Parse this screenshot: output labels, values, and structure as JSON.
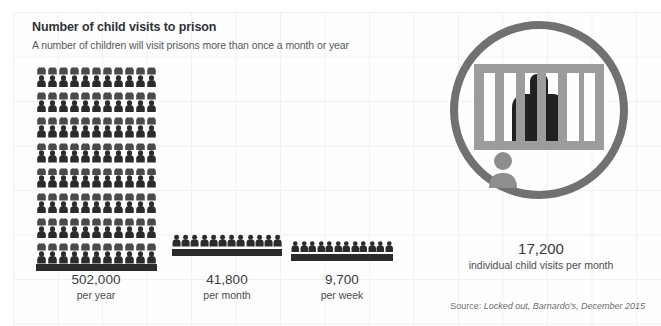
{
  "header": {
    "title": "Number of child visits to prison",
    "subtitle": "A number of children will visit prisons more than once a month or year"
  },
  "colors": {
    "background": "#fefefe",
    "gridline": "#f0f1f2",
    "figure_dark": "#2b2b2b",
    "figure_light": "#ffffff",
    "figure_mid": "#4a4a4a",
    "icon_grey": "#8c8c8c",
    "icon_dark": "#1f2123",
    "title_text": "#2f3336",
    "body_text": "#4a4d50",
    "source_text": "#6a6e71"
  },
  "chart_data": {
    "type": "pictogram",
    "title": "Number of child visits to prison",
    "subtitle": "A number of children will visit prisons more than once a month or year",
    "xlabel": "",
    "ylabel": "",
    "unit_note": "each icon represents a proportional share of child visits",
    "categories": [
      "per year",
      "per month",
      "per week"
    ],
    "values": [
      502000,
      41800,
      9700
    ],
    "value_labels": [
      "502,000",
      "41,800",
      "9,700"
    ],
    "icon_counts": [
      176,
      12,
      12
    ],
    "icon_grid": [
      {
        "columns": 11,
        "rows": 16
      },
      {
        "columns": 12,
        "rows": 1
      },
      {
        "columns": 12,
        "rows": 1
      }
    ],
    "legend": [],
    "grid": true,
    "annotations": [
      {
        "value": "17,200",
        "label": "individual child visits per month"
      }
    ],
    "source": "Source: Locked out, Barnardo's, December 2015"
  },
  "groups": [
    {
      "value": "502,000",
      "period": "per year"
    },
    {
      "value": "41,800",
      "period": "per month"
    },
    {
      "value": "9,700",
      "period": "per week"
    }
  ],
  "callout": {
    "value": "17,200",
    "caption": "individual child visits per month",
    "icon_name": "prisoner-behind-bars-icon"
  },
  "source": {
    "prefix": "Source: ",
    "publication": "Locked out, Barnardo's, December 2015",
    "full": "Source: Locked out, Barnardo's, December 2015"
  }
}
